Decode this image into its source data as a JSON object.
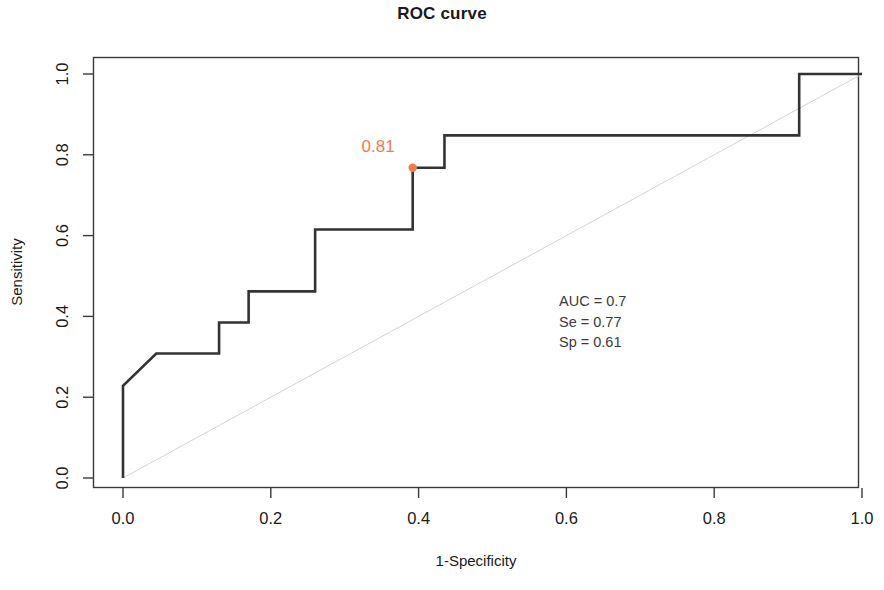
{
  "chart_data": {
    "type": "line",
    "title": "ROC curve",
    "xlabel": "1-Specificity",
    "ylabel": "Sensitivity",
    "xlim": [
      0.0,
      1.0
    ],
    "ylim": [
      0.0,
      1.0
    ],
    "grid": false,
    "legend": "none",
    "x_ticks": [
      "0.0",
      "0.2",
      "0.4",
      "0.6",
      "0.8",
      "1.0"
    ],
    "y_ticks": [
      "0.0",
      "0.2",
      "0.4",
      "0.6",
      "0.8",
      "1.0"
    ],
    "x_tick_values": [
      0.0,
      0.2,
      0.4,
      0.6,
      0.8,
      1.0
    ],
    "y_tick_values": [
      0.0,
      0.2,
      0.4,
      0.6,
      0.8,
      1.0
    ],
    "series": [
      {
        "name": "ROC curve",
        "color": "#333333",
        "line_width": 2.6,
        "x": [
          0.0,
          0.0,
          0.045,
          0.13,
          0.13,
          0.17,
          0.17,
          0.26,
          0.26,
          0.392,
          0.392,
          0.435,
          0.435,
          0.915,
          0.915,
          1.0
        ],
        "y": [
          0.0,
          0.228,
          0.308,
          0.308,
          0.385,
          0.385,
          0.462,
          0.462,
          0.615,
          0.615,
          0.768,
          0.768,
          0.848,
          0.848,
          1.0,
          1.0
        ]
      },
      {
        "name": "chance diagonal",
        "color": "#d8d2cd",
        "line_width": 1.0,
        "x": [
          0.0,
          1.0
        ],
        "y": [
          0.0,
          1.0
        ]
      }
    ],
    "marked_point": {
      "label": "0.81",
      "x": 0.392,
      "y": 0.768,
      "color": "#f4794f",
      "label_color": "#f4794f",
      "radius": 4.2
    },
    "annotations": [
      {
        "text": "AUC = 0.7",
        "x": 0.59,
        "y": 0.425
      },
      {
        "text": "Se = 0.77",
        "x": 0.59,
        "y": 0.375
      },
      {
        "text": "Sp = 0.61",
        "x": 0.59,
        "y": 0.325
      }
    ],
    "stats": {
      "auc": "AUC = 0.7",
      "se": "Se = 0.77",
      "sp": "Sp = 0.61"
    }
  }
}
